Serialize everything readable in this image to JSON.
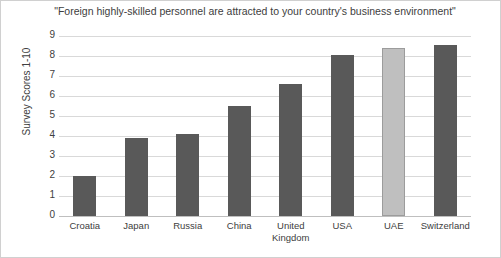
{
  "chart_data": {
    "type": "bar",
    "title": "\"Foreign highly-skilled personnel are attracted to your country's business environment\"",
    "xlabel": "",
    "ylabel": "Survey Scores 1-10",
    "categories": [
      "Croatia",
      "Japan",
      "Russia",
      "China",
      "United Kingdom",
      "USA",
      "UAE",
      "Switzerland"
    ],
    "values": [
      2.0,
      3.9,
      4.1,
      5.5,
      6.6,
      8.05,
      8.4,
      8.55
    ],
    "ylim": [
      0,
      9
    ],
    "yticks": [
      0,
      1,
      2,
      3,
      4,
      5,
      6,
      7,
      8,
      9
    ],
    "grid": true,
    "legend": false,
    "highlight_category": "UAE",
    "colors": {
      "bar": "#595959",
      "highlight_bar": "#bfbfbf",
      "highlight_border": "#9c9c9c",
      "gridline": "#d9d9d9",
      "baseline": "#bfbfbf",
      "text": "#404040",
      "background": "#ffffff",
      "frame": "#d0d0d0"
    }
  },
  "axis": {
    "ytitle": "Survey Scores 1-10",
    "ticks": [
      "9",
      "8",
      "7",
      "6",
      "5",
      "4",
      "3",
      "2",
      "1",
      "0"
    ]
  },
  "xlabels": [
    "Croatia",
    "Japan",
    "Russia",
    "China",
    "United\nKingdom",
    "USA",
    "UAE",
    "Switzerland"
  ]
}
